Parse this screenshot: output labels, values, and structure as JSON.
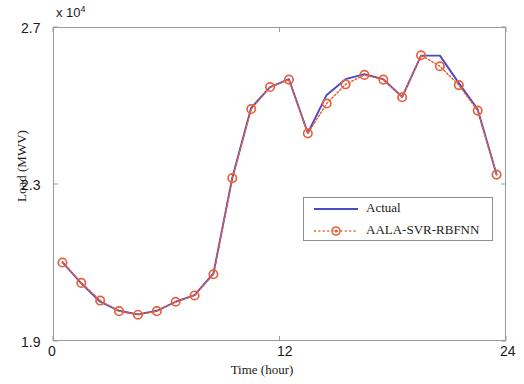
{
  "chart_data": {
    "type": "line",
    "title": "",
    "xlabel": "Time (hour)",
    "ylabel": "Load (MWV)",
    "y_exponent_label": "x 10",
    "y_exponent_value": "4",
    "y_multiplier": 10000,
    "xlim": [
      0,
      24
    ],
    "ylim": [
      19000,
      27000
    ],
    "xticks": [
      0,
      12,
      24
    ],
    "xticklabels": [
      "0",
      "12",
      "24"
    ],
    "yticks": [
      19000,
      23000,
      27000
    ],
    "yticklabels": [
      "1.9",
      "2.3",
      "2.7"
    ],
    "grid": false,
    "legend_position": "center-right",
    "x": [
      0.5,
      1.5,
      2.5,
      3.5,
      4.5,
      5.5,
      6.5,
      7.5,
      8.5,
      9.5,
      10.5,
      11.5,
      12.5,
      13.5,
      14.5,
      15.5,
      16.5,
      17.5,
      18.5,
      19.5,
      20.5,
      21.5,
      22.5,
      23.5
    ],
    "series": [
      {
        "name": "Actual",
        "color": "#4a4ac4",
        "style": "solid",
        "marker": "none",
        "values": [
          21010,
          20470,
          20000,
          19770,
          19680,
          19770,
          20000,
          20170,
          20720,
          23160,
          24940,
          25470,
          25670,
          24300,
          25270,
          25670,
          25800,
          25670,
          25220,
          26270,
          26270,
          25570,
          24900,
          23240
        ]
      },
      {
        "name": "AALA-SVR-RBFNN",
        "color": "#e8613c",
        "style": "dotted",
        "marker": "circle",
        "values": [
          21000,
          20480,
          20030,
          19760,
          19670,
          19760,
          20000,
          20160,
          20700,
          23150,
          24910,
          25470,
          25660,
          24290,
          25050,
          25540,
          25780,
          25660,
          25210,
          26280,
          26000,
          25520,
          24870,
          23240
        ]
      }
    ],
    "annotations": []
  },
  "axis": {
    "y_exponent_prefix": "x 10",
    "y_exponent_sup": "4",
    "ytick_top": "2.7",
    "ytick_mid": "2.3",
    "ytick_bottom": "1.9",
    "xtick_left": "0",
    "xtick_mid": "12",
    "xtick_right": "24",
    "xlabel": "Time (hour)",
    "ylabel": "Load (MWV)"
  },
  "legend": {
    "entries": [
      {
        "label": "Actual",
        "color": "#4a4ac4",
        "style": "solid",
        "marker": "none"
      },
      {
        "label": "AALA-SVR-RBFNN",
        "color": "#e8613c",
        "style": "dotted",
        "marker": "circle"
      }
    ]
  },
  "colors": {
    "actual_line": "#4a4ac4",
    "prediction_line": "#e8613c",
    "marker_edge": "#e8613c",
    "axis": "#9a9a9a",
    "text": "#1a1a1a",
    "background": "#ffffff"
  }
}
